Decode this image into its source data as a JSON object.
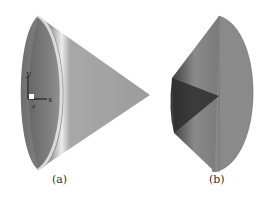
{
  "figure": {
    "panels": [
      {
        "id": "a",
        "caption": "(a)",
        "description": "smooth shaded cone surface with coordinate axes"
      },
      {
        "id": "b",
        "caption": "(b)",
        "description": "mesh-rendered cone seen from base side"
      }
    ],
    "axes": {
      "x": "x",
      "y": "y",
      "z": "z"
    },
    "colors": {
      "surface": "#8a8a8a",
      "highlight": "#e6e6e6",
      "mesh_dark": "#2a2a2a"
    }
  }
}
